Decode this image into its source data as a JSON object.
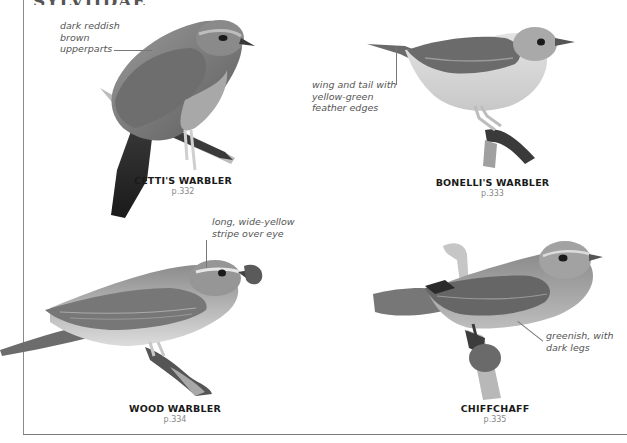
{
  "header": {
    "family_title": "SYLVIIDAE"
  },
  "species": [
    {
      "name": "CETTI'S WARBLER",
      "page": "p.332",
      "annotation": "dark reddish\nbrown\nupperparts",
      "icon": "cettis-warbler-illustration"
    },
    {
      "name": "BONELLI'S WARBLER",
      "page": "p.333",
      "annotation": "wing and tail with\nyellow-green\nfeather edges",
      "icon": "bonellis-warbler-illustration"
    },
    {
      "name": "WOOD WARBLER",
      "page": "p.334",
      "annotation": "long, wide-yellow\nstripe over eye",
      "icon": "wood-warbler-illustration"
    },
    {
      "name": "CHIFFCHAFF",
      "page": "p.335",
      "annotation": "greenish, with\ndark legs",
      "icon": "chiffchaff-illustration"
    }
  ],
  "colors": {
    "frame": "#8a8a8a",
    "title_text": "#1a1a1a",
    "page_ref": "#888888",
    "annotation_text": "#555555"
  }
}
